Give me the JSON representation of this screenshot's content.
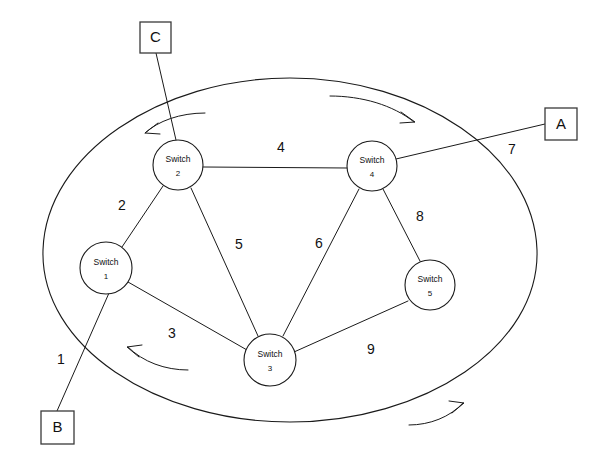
{
  "diagram": {
    "canvas": {
      "width": 592,
      "height": 460
    },
    "colors": {
      "stroke": "#1a1a1a",
      "background": "#ffffff",
      "text": "#111111"
    },
    "cloud": {
      "name": "network-cloud",
      "cx": 290,
      "cy": 250,
      "rx": 248,
      "ry": 172,
      "arcs": 4
    },
    "nodes": [
      {
        "id": "switch1",
        "type_label": "Switch",
        "number": "1",
        "cx": 106,
        "cy": 268,
        "r": 26
      },
      {
        "id": "switch2",
        "type_label": "Switch",
        "number": "2",
        "cx": 178,
        "cy": 165,
        "r": 25
      },
      {
        "id": "switch3",
        "type_label": "Switch",
        "number": "3",
        "cx": 270,
        "cy": 360,
        "r": 26
      },
      {
        "id": "switch4",
        "type_label": "Switch",
        "number": "4",
        "cx": 372,
        "cy": 166,
        "r": 25
      },
      {
        "id": "switch5",
        "type_label": "Switch",
        "number": "5",
        "cx": 430,
        "cy": 285,
        "r": 25
      }
    ],
    "terminals": [
      {
        "id": "termA",
        "label": "A",
        "x": 545,
        "y": 108,
        "w": 32,
        "h": 32
      },
      {
        "id": "termB",
        "label": "B",
        "x": 41,
        "y": 411,
        "w": 33,
        "h": 33
      },
      {
        "id": "termC",
        "label": "C",
        "x": 140,
        "y": 22,
        "w": 31,
        "h": 31
      }
    ],
    "links": [
      {
        "id": "link1",
        "label": "1",
        "from": "termB",
        "to": "switch1",
        "lx": 61,
        "ly": 360
      },
      {
        "id": "link2",
        "label": "2",
        "from": "switch1",
        "to": "switch2",
        "lx": 122,
        "ly": 206
      },
      {
        "id": "link3",
        "label": "3",
        "from": "switch1",
        "to": "switch3",
        "lx": 172,
        "ly": 334
      },
      {
        "id": "link4",
        "label": "4",
        "from": "switch2",
        "to": "switch4",
        "lx": 281,
        "ly": 148
      },
      {
        "id": "link5",
        "label": "5",
        "from": "switch2",
        "to": "switch3",
        "lx": 239,
        "ly": 245
      },
      {
        "id": "link6",
        "label": "6",
        "from": "switch4",
        "to": "switch3",
        "lx": 319,
        "ly": 244
      },
      {
        "id": "link7",
        "label": "7",
        "from": "switch4",
        "to": "termA",
        "lx": 512,
        "ly": 150
      },
      {
        "id": "link8",
        "label": "8",
        "from": "switch4",
        "to": "switch5",
        "lx": 420,
        "ly": 217
      },
      {
        "id": "link9",
        "label": "9",
        "from": "switch3",
        "to": "switch5",
        "lx": 371,
        "ly": 350
      },
      {
        "id": "linkC",
        "label": "",
        "from": "termC",
        "to": "switch2",
        "lx": 0,
        "ly": 0
      }
    ]
  }
}
